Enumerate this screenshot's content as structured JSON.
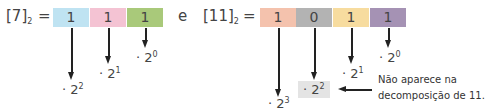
{
  "left": {
    "label_number": "7",
    "label_base": "2",
    "equals": "=",
    "digits": [
      {
        "value": "1",
        "color": "#bfe3f2",
        "power": "· 2",
        "exp": "2"
      },
      {
        "value": "1",
        "color": "#f4c3d3",
        "power": "· 2",
        "exp": "1"
      },
      {
        "value": "1",
        "color": "#a9c97a",
        "power": "· 2",
        "exp": "0"
      }
    ]
  },
  "connector": "e",
  "right": {
    "label_number": "11",
    "label_base": "2",
    "equals": "=",
    "digits": [
      {
        "value": "1",
        "color": "#f4c2ad",
        "power": "· 2",
        "exp": "3"
      },
      {
        "value": "0",
        "color": "#b3b3b3",
        "power": "· 2",
        "exp": "2"
      },
      {
        "value": "1",
        "color": "#f7dc9f",
        "power": "· 2",
        "exp": "1"
      },
      {
        "value": "1",
        "color": "#a592b4",
        "power": "· 2",
        "exp": "0"
      }
    ]
  },
  "note": {
    "line1": "Não aparece na",
    "line2": "decomposição de 11."
  }
}
